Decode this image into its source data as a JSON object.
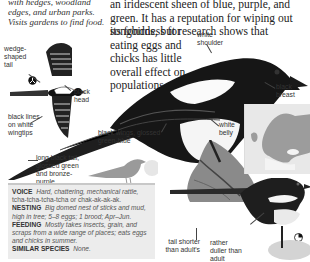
{
  "habitat_text": "with hedges, woodland edges, and urban parks. Visits gardens to find food.",
  "intro_text_top": "an iridescent sheen of blue, purple, and green. It has a reputation for wiping out songbirds, but research shows that",
  "intro_text_wrap": "its fondness for eating eggs and chicks has little overall effect on populations.",
  "labels": {
    "wedge_tail": "wedge-shaped tail",
    "black_head": "black head",
    "black_lines": "black lines on white wingtips",
    "white_shoulder": "white shoulder",
    "black_breast": "black breast",
    "white_belly": "white belly",
    "black_wings": "black wings, glossed green-blue",
    "long_tail": "long black tail, glossed green and bronze-purple",
    "tail_shorter": "tail shorter than adult's",
    "rather_duller": "rather duller than adult"
  },
  "info": {
    "voice_label": "VOICE",
    "voice_text": "Hard, chattering, mechanical rattle,",
    "voice_call": "tcha-tcha-tcha-tcha or chak-ak-ak-ak.",
    "nesting_label": "NESTING",
    "nesting_text": "Big domed nest of sticks and mud, high in tree; 5–8 eggs; 1 brood; Apr–Jun.",
    "feeding_label": "FEEDING",
    "feeding_text": "Mostly takes insects, grain, and scraps from a wide range of places; eats eggs and chicks in summer.",
    "similar_label": "SIMILAR SPECIES",
    "similar_text": "None."
  },
  "colors": {
    "info_bg": "#ececec",
    "silhouette": "#9a9a9a",
    "map_land": "#9c9c9c"
  }
}
